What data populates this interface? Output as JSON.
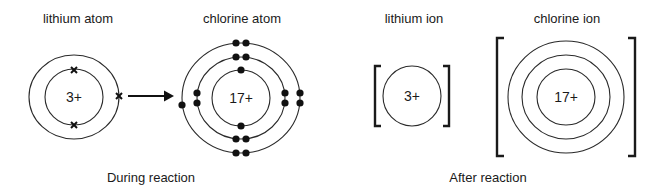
{
  "diagram": {
    "title_labels": {
      "lithium_atom": "lithium atom",
      "chlorine_atom": "chlorine atom",
      "lithium_ion": "lithium ion",
      "chlorine_ion": "chlorine ion"
    },
    "section_labels": {
      "during": "During reaction",
      "after": "After reaction"
    },
    "lithium_atom": {
      "nucleus_charge": "3+",
      "shells": [
        2,
        1
      ],
      "electron_symbol": "cross"
    },
    "chlorine_atom": {
      "nucleus_charge": "17+",
      "shells": [
        2,
        8,
        7
      ],
      "electron_symbol": "dot"
    },
    "lithium_ion": {
      "nucleus_charge": "3+",
      "shells_drawn": 1,
      "bracketed": true
    },
    "chlorine_ion": {
      "nucleus_charge": "17+",
      "shells_drawn": 3,
      "bracketed": true
    },
    "arrow": {
      "from": "lithium outer electron",
      "to": "chlorine outer shell"
    },
    "colors": {
      "ink": "#1a1a1a",
      "background": "#ffffff"
    }
  }
}
